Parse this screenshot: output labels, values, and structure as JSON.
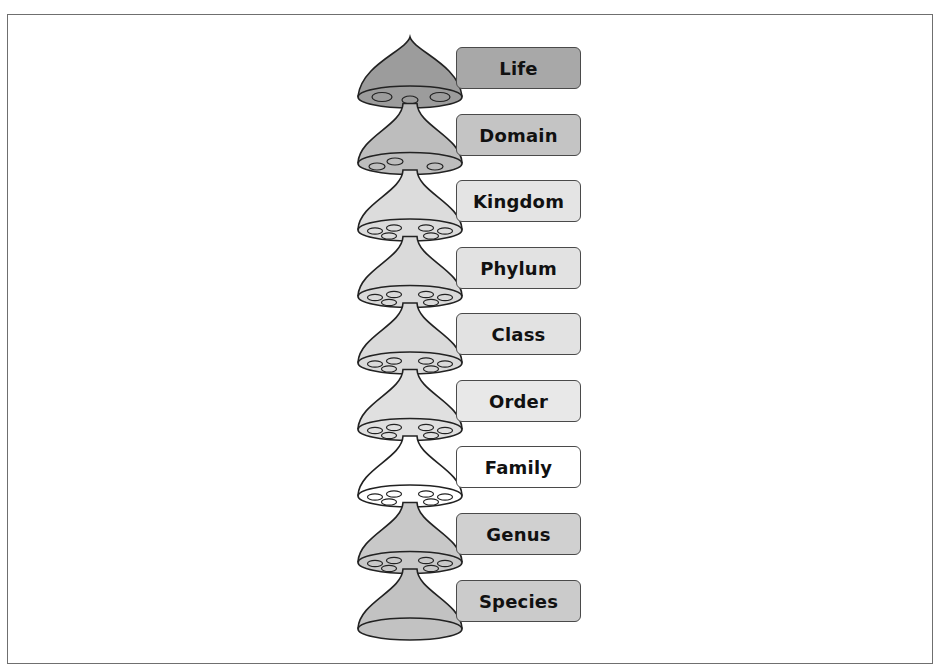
{
  "diagram": {
    "title": "",
    "type": "taxonomic-rank-hierarchy",
    "levels": [
      {
        "label": "Life",
        "fill": "#9c9c9c",
        "box_fill": "#a8a8a8",
        "bottom": "pores-3"
      },
      {
        "label": "Domain",
        "fill": "#bdbdbd",
        "box_fill": "#c4c4c4",
        "bottom": "pores-4"
      },
      {
        "label": "Kingdom",
        "fill": "#dcdcdc",
        "box_fill": "#e4e4e4",
        "bottom": "pores-6"
      },
      {
        "label": "Phylum",
        "fill": "#dadada",
        "box_fill": "#e2e2e2",
        "bottom": "pores-6"
      },
      {
        "label": "Class",
        "fill": "#dadada",
        "box_fill": "#e2e2e2",
        "bottom": "pores-6"
      },
      {
        "label": "Order",
        "fill": "#e0e0e0",
        "box_fill": "#e8e8e8",
        "bottom": "pores-6"
      },
      {
        "label": "Family",
        "fill": "#ffffff",
        "box_fill": "#ffffff",
        "bottom": "pores-6"
      },
      {
        "label": "Genus",
        "fill": "#c8c8c8",
        "box_fill": "#d0d0d0",
        "bottom": "pores-6"
      },
      {
        "label": "Species",
        "fill": "#c2c2c2",
        "box_fill": "#cbcbcb",
        "bottom": "closed"
      }
    ]
  }
}
